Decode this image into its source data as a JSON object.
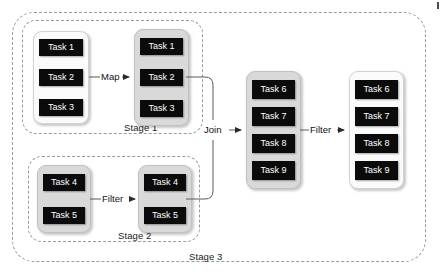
{
  "diagram": {
    "outer_stage": {
      "label": "Stage 3"
    },
    "stages": [
      {
        "id": "stage-1",
        "label": "Stage 1"
      },
      {
        "id": "stage-2",
        "label": "Stage 2"
      }
    ],
    "task_groups": [
      {
        "id": "group-stage1-input",
        "fill": "light",
        "tasks": [
          "Task 1",
          "Task 2",
          "Task 3"
        ]
      },
      {
        "id": "group-stage1-output",
        "fill": "shaded",
        "tasks": [
          "Task 1",
          "Task 2",
          "Task 3"
        ]
      },
      {
        "id": "group-stage2-input",
        "fill": "shaded",
        "tasks": [
          "Task 4",
          "Task 5"
        ]
      },
      {
        "id": "group-stage2-output",
        "fill": "shaded",
        "tasks": [
          "Task 4",
          "Task 5"
        ]
      },
      {
        "id": "group-stage3-input",
        "fill": "shaded",
        "tasks": [
          "Task 6",
          "Task 7",
          "Task 8",
          "Task 9"
        ]
      },
      {
        "id": "group-stage3-output",
        "fill": "light",
        "tasks": [
          "Task 6",
          "Task 7",
          "Task 8",
          "Task 9"
        ]
      }
    ],
    "connectors": [
      {
        "id": "conn-map",
        "label": "Map"
      },
      {
        "id": "conn-filter-s2",
        "label": "Filter"
      },
      {
        "id": "conn-join",
        "label": "Join"
      },
      {
        "id": "conn-filter-s3",
        "label": "Filter"
      }
    ],
    "colors": {
      "task_fill": "#0b0b0b",
      "task_text": "#ffffff",
      "group_shaded": "#d9d9d9",
      "group_light": "#fbfbfb",
      "dashed_border": "#9a9a9a",
      "connector_line": "#5a5a5a",
      "background": "#ffffff"
    }
  }
}
